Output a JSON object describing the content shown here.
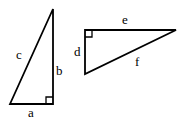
{
  "diagram": {
    "triangle1": {
      "right_angle": "bottom-right",
      "labels": {
        "hypotenuse": "c",
        "vertical_leg": "b",
        "horizontal_leg": "a"
      }
    },
    "triangle2": {
      "right_angle": "top-left",
      "labels": {
        "horizontal_leg": "e",
        "vertical_leg": "d",
        "hypotenuse": "f"
      }
    },
    "colors": {
      "line": "#000000",
      "background": "#ffffff"
    }
  }
}
